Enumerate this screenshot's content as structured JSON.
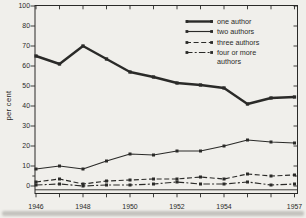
{
  "colors": {
    "paper": "#f0efeb",
    "ink": "#2a2a28"
  },
  "chart_data": {
    "type": "line",
    "title": "",
    "xlabel": "",
    "ylabel": "per cent",
    "ylim": [
      0,
      100
    ],
    "grid": false,
    "legend_position": "top-right-inside",
    "y_axis_note": "ticks every 10 per cent; 90 not printed, top tick labeled 100 one step above 80; small unlabeled minor tick near 5",
    "y_tick_values": [
      0,
      10,
      20,
      30,
      40,
      50,
      60,
      70,
      80,
      100
    ],
    "y_minor_tick_values": [
      5
    ],
    "x": [
      1946,
      1947,
      1948,
      1949,
      1950,
      1951,
      1952,
      1953,
      1954,
      1955,
      1956,
      1957
    ],
    "x_axis_labeled_years": [
      1946,
      1948,
      1950,
      1952,
      1954,
      1957
    ],
    "series": [
      {
        "name": "one author",
        "line": "solid-thick",
        "values": [
          65,
          61,
          70,
          63.5,
          57,
          54.5,
          51.5,
          50.5,
          49,
          41,
          44,
          44.5
        ]
      },
      {
        "name": "two authors",
        "line": "solid",
        "values": [
          8.5,
          10,
          8.5,
          12.5,
          16,
          15.5,
          17.5,
          17.5,
          20,
          23,
          22,
          21.5
        ]
      },
      {
        "name": "three authors",
        "line": "dashed",
        "values": [
          2,
          3.5,
          1,
          2.5,
          3,
          3.5,
          3.5,
          4.5,
          3.5,
          6,
          5,
          5.5
        ]
      },
      {
        "name": "four or more authors",
        "line": "dash-dot",
        "values": [
          0.5,
          1,
          0,
          0.5,
          0.5,
          1,
          2,
          1,
          1,
          2,
          0.5,
          1
        ]
      }
    ]
  }
}
